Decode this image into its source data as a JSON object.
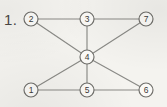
{
  "figure": {
    "item_number": "1.",
    "width": 167,
    "height": 107,
    "background_color": "#f4f3ef",
    "edge_color": "#8a8a86",
    "node_fill_color": "#fbfaf7",
    "node_stroke_color": "#6f6e6a",
    "label_color": "#3c3b38"
  },
  "graph": {
    "node_radius": 7,
    "nodes": [
      {
        "id": "n2",
        "label": "2",
        "x": 31,
        "y": 19
      },
      {
        "id": "n3",
        "label": "3",
        "x": 87,
        "y": 19
      },
      {
        "id": "n7",
        "label": "7",
        "x": 146,
        "y": 19
      },
      {
        "id": "n4",
        "label": "4",
        "x": 87,
        "y": 57
      },
      {
        "id": "n1",
        "label": "1",
        "x": 31,
        "y": 90
      },
      {
        "id": "n5",
        "label": "5",
        "x": 87,
        "y": 90
      },
      {
        "id": "n6",
        "label": "6",
        "x": 146,
        "y": 90
      }
    ],
    "edges": [
      {
        "from": "2",
        "to": "3"
      },
      {
        "from": "3",
        "to": "7"
      },
      {
        "from": "2",
        "to": "4"
      },
      {
        "from": "3",
        "to": "4"
      },
      {
        "from": "7",
        "to": "4"
      },
      {
        "from": "4",
        "to": "1"
      },
      {
        "from": "4",
        "to": "5"
      },
      {
        "from": "4",
        "to": "6"
      },
      {
        "from": "1",
        "to": "5"
      },
      {
        "from": "5",
        "to": "6"
      }
    ]
  }
}
